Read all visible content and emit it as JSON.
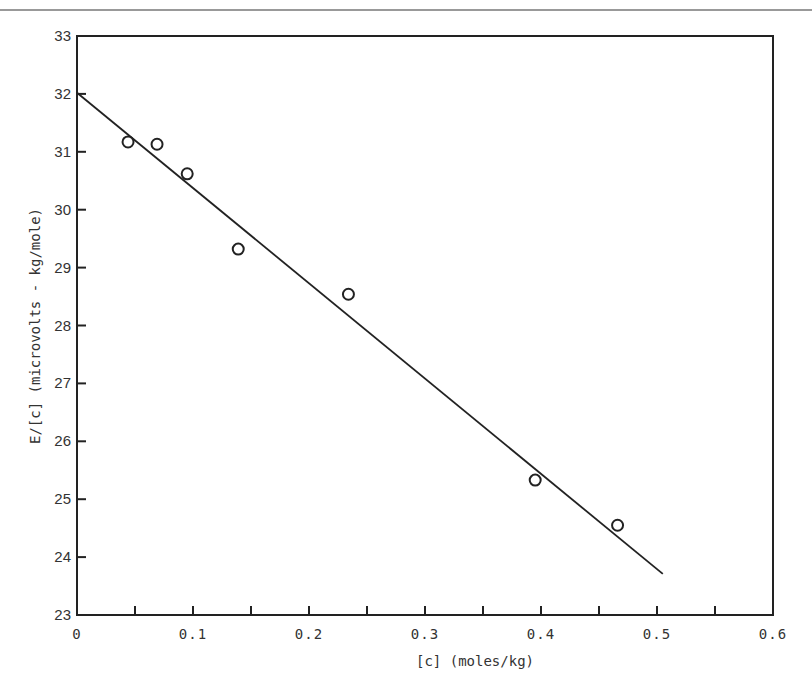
{
  "chart_data": {
    "type": "scatter",
    "title": "",
    "xlabel": "[c] (moles/kg)",
    "ylabel": "E/[c] (microvolts - kg/mole)",
    "xlim": [
      0,
      0.6
    ],
    "ylim": [
      23,
      33
    ],
    "x_ticks": [
      0,
      0.1,
      0.2,
      0.3,
      0.4,
      0.5,
      0.6
    ],
    "x_tick_labels": [
      "0",
      "0.1",
      "0.2",
      "0.3",
      "0.4",
      "0.5",
      "0.6"
    ],
    "x_minor_ticks": [
      0.05,
      0.1,
      0.15,
      0.2,
      0.25,
      0.3,
      0.35,
      0.4,
      0.45,
      0.5,
      0.55
    ],
    "y_ticks": [
      23,
      24,
      25,
      26,
      27,
      28,
      29,
      30,
      31,
      32,
      33
    ],
    "y_tick_labels": [
      "23",
      "24",
      "25",
      "26",
      "27",
      "28",
      "29",
      "30",
      "31",
      "32",
      "33"
    ],
    "grid": false,
    "legend": null,
    "series": [
      {
        "name": "measured",
        "type": "scatter",
        "marker": "open-circle",
        "x": [
          0.044,
          0.069,
          0.095,
          0.139,
          0.234,
          0.395,
          0.466
        ],
        "y": [
          31.17,
          31.13,
          30.62,
          29.32,
          28.54,
          25.33,
          24.55
        ]
      },
      {
        "name": "linear fit",
        "type": "line",
        "x": [
          0,
          0.505
        ],
        "y": [
          32.02,
          23.71
        ]
      }
    ]
  },
  "colors": {
    "ink": "#222222",
    "text": "#333333",
    "rule": "#777777",
    "background": "#ffffff"
  }
}
